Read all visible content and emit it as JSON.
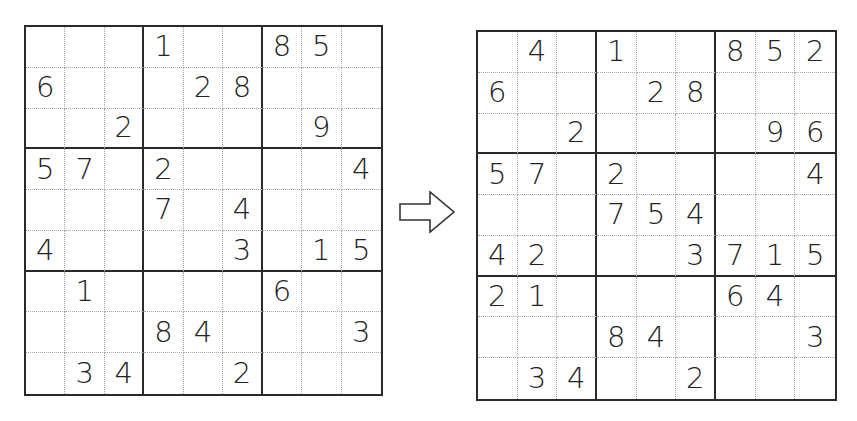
{
  "puzzle": {
    "label": "Sudoku puzzle (given clues)",
    "rows": [
      [
        "",
        "",
        "",
        "1",
        "",
        "",
        "8",
        "5",
        ""
      ],
      [
        "6",
        "",
        "",
        "",
        "2",
        "8",
        "",
        "",
        ""
      ],
      [
        "",
        "",
        "2",
        "",
        "",
        "",
        "",
        "9",
        ""
      ],
      [
        "5",
        "7",
        "",
        "2",
        "",
        "",
        "",
        "",
        "4"
      ],
      [
        "",
        "",
        "",
        "7",
        "",
        "4",
        "",
        "",
        ""
      ],
      [
        "4",
        "",
        "",
        "",
        "",
        "3",
        "",
        "1",
        "5"
      ],
      [
        "",
        "1",
        "",
        "",
        "",
        "",
        "6",
        "",
        ""
      ],
      [
        "",
        "",
        "",
        "8",
        "4",
        "",
        "",
        "",
        "3"
      ],
      [
        "",
        "3",
        "4",
        "",
        "",
        "2",
        "",
        "",
        ""
      ]
    ]
  },
  "arrow": {
    "icon": "right-arrow-icon"
  },
  "result": {
    "label": "Sudoku puzzle (partially filled)",
    "rows": [
      [
        "",
        "4",
        "",
        "1",
        "",
        "",
        "8",
        "5",
        "2"
      ],
      [
        "6",
        "",
        "",
        "",
        "2",
        "8",
        "",
        "",
        ""
      ],
      [
        "",
        "",
        "2",
        "",
        "",
        "",
        "",
        "9",
        "6"
      ],
      [
        "5",
        "7",
        "",
        "2",
        "",
        "",
        "",
        "",
        "4"
      ],
      [
        "",
        "",
        "",
        "7",
        "5",
        "4",
        "",
        "",
        ""
      ],
      [
        "4",
        "2",
        "",
        "",
        "",
        "3",
        "7",
        "1",
        "5"
      ],
      [
        "2",
        "1",
        "",
        "",
        "",
        "",
        "6",
        "4",
        ""
      ],
      [
        "",
        "",
        "",
        "8",
        "4",
        "",
        "",
        "",
        "3"
      ],
      [
        "",
        "3",
        "4",
        "",
        "",
        "2",
        "",
        "",
        ""
      ]
    ]
  }
}
